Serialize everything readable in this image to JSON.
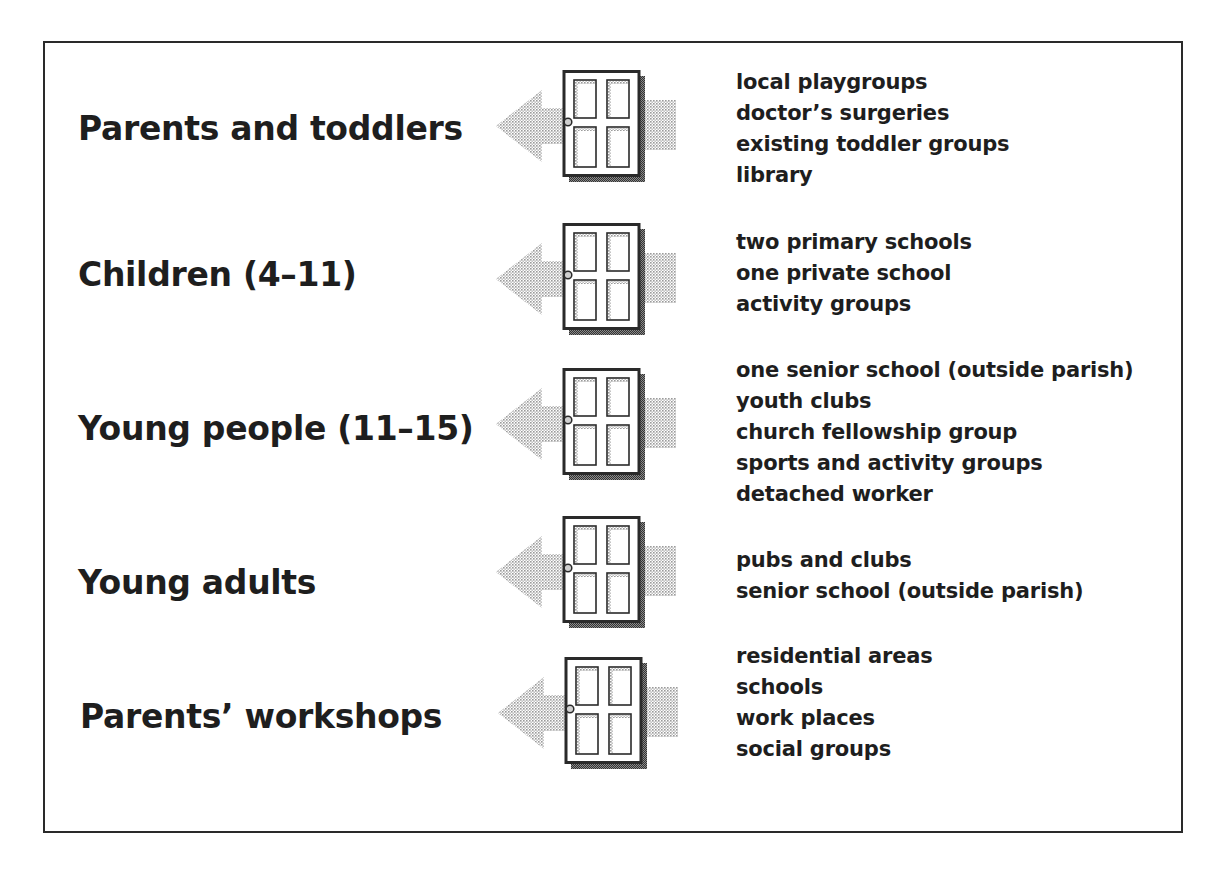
{
  "diagram": {
    "colors": {
      "border": "#2a2a2a",
      "text": "#1e1e1e",
      "arrow": "#bdbdbd",
      "door_shadow": "#6a6a6a"
    },
    "rows": [
      {
        "label": "Parents and toddlers",
        "icon": "door-with-arrow-icon",
        "items": [
          "local playgroups",
          "doctor’s surgeries",
          "existing toddler groups",
          "library"
        ]
      },
      {
        "label": "Children (4–11)",
        "icon": "door-with-arrow-icon",
        "items": [
          "two primary schools",
          "one private school",
          "activity groups"
        ]
      },
      {
        "label": "Young people (11–15)",
        "icon": "door-with-arrow-icon",
        "items": [
          "one senior school (outside parish)",
          "youth clubs",
          "church fellowship group",
          "sports and activity groups",
          "detached worker"
        ]
      },
      {
        "label": "Young adults",
        "icon": "door-with-arrow-icon",
        "items": [
          "pubs and clubs",
          "senior school (outside parish)"
        ]
      },
      {
        "label": "Parents’ workshops",
        "icon": "door-with-arrow-icon",
        "items": [
          "residential areas",
          "schools",
          "work places",
          "social groups"
        ]
      }
    ]
  }
}
